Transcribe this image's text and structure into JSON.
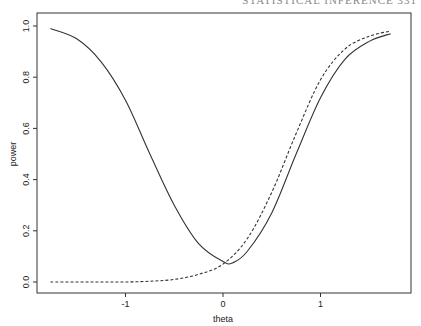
{
  "header": {
    "cut_text": "STATISTICAL INFERENCE   331"
  },
  "chart_data": {
    "type": "line",
    "title": "",
    "xlabel": "theta",
    "ylabel": "power",
    "xlim": [
      -1.9,
      1.94
    ],
    "ylim": [
      -0.04,
      1.05
    ],
    "x_ticks": [
      -1,
      0,
      1
    ],
    "x_tick_labels": [
      "-1",
      "0",
      "1"
    ],
    "y_ticks": [
      0.0,
      0.2,
      0.4,
      0.6,
      0.8,
      1.0
    ],
    "y_tick_labels": [
      "0.0",
      "0.2",
      "0.4",
      "0.6",
      "0.8",
      "1.0"
    ],
    "grid": false,
    "legend": null,
    "series": [
      {
        "name": "solid",
        "style": "solid",
        "x": [
          -1.77,
          -1.5,
          -1.25,
          -1.0,
          -0.75,
          -0.5,
          -0.25,
          0.0,
          0.1,
          0.25,
          0.5,
          0.75,
          1.0,
          1.25,
          1.5,
          1.72
        ],
        "y": [
          0.99,
          0.95,
          0.86,
          0.71,
          0.5,
          0.3,
          0.15,
          0.08,
          0.075,
          0.12,
          0.27,
          0.5,
          0.72,
          0.87,
          0.94,
          0.97
        ]
      },
      {
        "name": "dashed",
        "style": "dashed",
        "x": [
          -1.77,
          -1.5,
          -1.25,
          -1.0,
          -0.75,
          -0.5,
          -0.25,
          0.0,
          0.25,
          0.5,
          0.75,
          1.0,
          1.25,
          1.5,
          1.72
        ],
        "y": [
          0.0,
          0.0,
          0.0,
          0.0,
          0.003,
          0.01,
          0.03,
          0.07,
          0.17,
          0.35,
          0.58,
          0.79,
          0.91,
          0.96,
          0.98
        ]
      }
    ]
  }
}
